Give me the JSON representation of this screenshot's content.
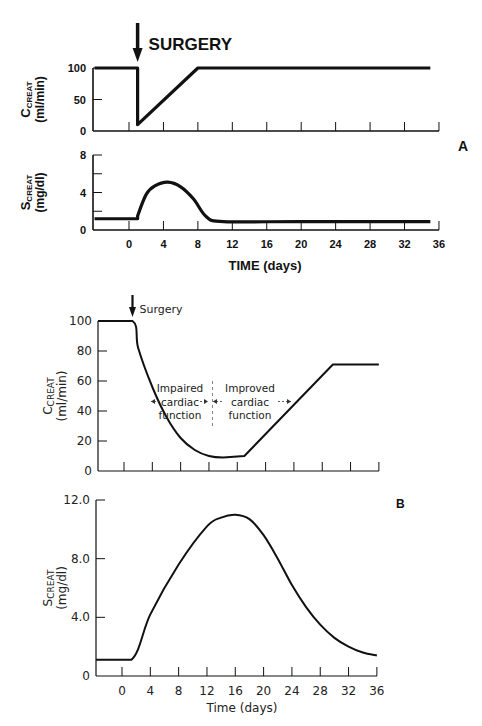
{
  "chart_data": [
    {
      "panel": "A",
      "id": "A-top",
      "type": "line",
      "title": "",
      "annotation": "SURGERY",
      "annotation_x": 1,
      "xlabel": "",
      "ylabel_main": "C",
      "ylabel_sub": "CREAT",
      "ylabel_unit": "(ml/min)",
      "ylim": [
        0,
        100
      ],
      "yticks": [
        0,
        50,
        100
      ],
      "ytick_labels": [
        "0",
        "50",
        "100"
      ],
      "xlim": [
        -4,
        36
      ],
      "xticks": [
        0,
        4,
        8,
        12,
        16,
        20,
        24,
        28,
        32,
        36
      ],
      "grid": false,
      "x": [
        -4,
        1,
        1,
        8,
        35
      ],
      "values": [
        100,
        100,
        10,
        100,
        100
      ]
    },
    {
      "panel": "A",
      "id": "A-bottom",
      "type": "line",
      "title": "",
      "xlabel": "TIME (days)",
      "ylabel_main": "S",
      "ylabel_sub": "CREAT",
      "ylabel_unit": "(mg/dl)",
      "ylim": [
        0,
        8
      ],
      "yticks": [
        0,
        2,
        4,
        6,
        8
      ],
      "ytick_labels": [
        "0",
        "",
        "4",
        "",
        "8"
      ],
      "xlim": [
        -4,
        36
      ],
      "xticks": [
        0,
        4,
        8,
        12,
        16,
        20,
        24,
        28,
        32,
        36
      ],
      "xtick_labels": [
        "0",
        "4",
        "8",
        "12",
        "16",
        "20",
        "24",
        "28",
        "32",
        "36"
      ],
      "grid": false,
      "x": [
        -4,
        1,
        1,
        2,
        3,
        4.5,
        6,
        7.5,
        9,
        11,
        20,
        35
      ],
      "values": [
        1.2,
        1.2,
        1.5,
        3.8,
        4.7,
        5.1,
        4.6,
        3.3,
        1.4,
        0.9,
        0.9,
        0.9
      ]
    },
    {
      "panel": "B",
      "id": "B-top",
      "type": "line",
      "title": "",
      "annotation": "Surgery",
      "annotation_x": 1.2,
      "region_labels": [
        {
          "lines": [
            "Impaired",
            "cardiac",
            "function"
          ],
          "span": [
            4,
            12.5
          ]
        },
        {
          "lines": [
            "Improved",
            "cardiac",
            "function"
          ],
          "span": [
            12.5,
            24
          ]
        }
      ],
      "divider_x": 12.5,
      "xlabel": "",
      "ylabel_main": "C",
      "ylabel_sub": "CREAT",
      "ylabel_unit": "(ml/min)",
      "ylim": [
        0,
        100
      ],
      "yticks": [
        0,
        20,
        40,
        60,
        80,
        100
      ],
      "ytick_labels": [
        "0",
        "20",
        "40",
        "60",
        "80",
        "100"
      ],
      "xlim": [
        -3.7,
        36
      ],
      "xticks": [
        0,
        4,
        8,
        12,
        16,
        20,
        24,
        28,
        32,
        36
      ],
      "grid": false,
      "x": [
        -3.7,
        1.2,
        2,
        4,
        6,
        8,
        10,
        12,
        14,
        17,
        29.5,
        36
      ],
      "values": [
        100,
        100,
        82,
        56,
        36,
        22,
        14,
        10,
        9,
        10,
        71,
        71
      ]
    },
    {
      "panel": "B",
      "id": "B-bottom",
      "type": "line",
      "title": "",
      "xlabel": "Time (days)",
      "ylabel_main": "S",
      "ylabel_sub": "CREAT",
      "ylabel_unit": "(mg/dl)",
      "ylim": [
        0,
        12
      ],
      "yticks": [
        0,
        4,
        8,
        12
      ],
      "ytick_labels": [
        "0",
        "4.0",
        "8.0",
        "12.0"
      ],
      "xlim": [
        -3.7,
        36
      ],
      "xticks": [
        0,
        4,
        8,
        12,
        16,
        20,
        24,
        28,
        32,
        36
      ],
      "xtick_labels": [
        "0",
        "4",
        "8",
        "12",
        "16",
        "20",
        "24",
        "28",
        "32",
        "36"
      ],
      "grid": false,
      "x": [
        -3.7,
        1.3,
        4,
        8,
        12,
        14,
        16,
        18,
        20,
        22,
        24,
        26,
        28,
        30,
        32,
        34,
        36
      ],
      "values": [
        1.1,
        1.1,
        4.2,
        7.6,
        10.2,
        10.8,
        11.0,
        10.7,
        9.6,
        8.0,
        6.2,
        4.7,
        3.5,
        2.6,
        2.0,
        1.6,
        1.4
      ]
    }
  ],
  "panels": {
    "A": {
      "label": "A"
    },
    "B": {
      "label": "B"
    }
  }
}
